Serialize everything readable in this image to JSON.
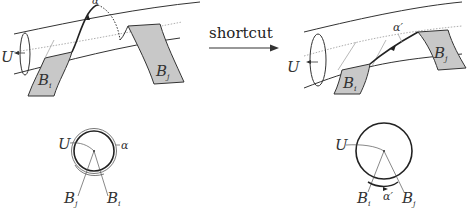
{
  "arrow": {
    "label": "shortcut"
  },
  "left_figure": {
    "labels": {
      "alpha": "α",
      "U": "U",
      "Bi": "B",
      "Bi_sub": "i",
      "Bj": "B",
      "Bj_sub": "j"
    }
  },
  "right_figure": {
    "labels": {
      "alpha_prime": "α′",
      "U": "U",
      "Bi": "B",
      "Bi_sub": "i",
      "Bj": "B",
      "Bj_sub": "j"
    }
  },
  "left_circle": {
    "labels": {
      "U": "U",
      "alpha": "α",
      "Bj": "B",
      "Bj_sub": "j",
      "Bi": "B",
      "Bi_sub": "i"
    }
  },
  "right_circle": {
    "labels": {
      "U": "U",
      "alpha_prime": "α′",
      "Bi": "B",
      "Bi_sub": "i",
      "Bj": "B",
      "Bj_sub": "j"
    }
  },
  "colors": {
    "band_fill": "#c8c8c8",
    "stroke": "#333333",
    "light_stroke": "#888888"
  }
}
